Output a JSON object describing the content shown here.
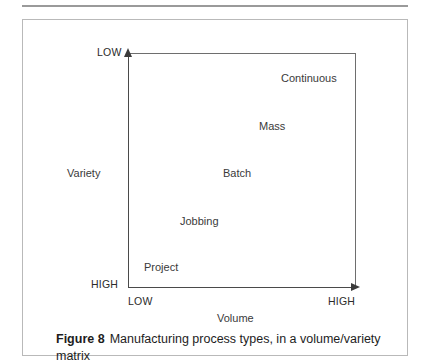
{
  "figure": {
    "caption_prefix": "Figure 8",
    "caption_text": "Manufacturing process types, in a volume/variety matrix"
  },
  "chart_data": {
    "type": "scatter",
    "title": "Manufacturing process types, in a volume/variety matrix",
    "xlabel": "Volume",
    "ylabel": "Variety",
    "grid": false,
    "legend": null,
    "x_axis": {
      "label": "Volume",
      "low_label": "LOW",
      "high_label": "HIGH",
      "direction": "left-to-right increasing"
    },
    "y_axis": {
      "label": "Variety",
      "low_label": "LOW",
      "high_label": "HIGH",
      "direction": "bottom-to-top decreasing"
    },
    "categories": [
      "Project",
      "Jobbing",
      "Batch",
      "Mass",
      "Continuous"
    ],
    "points": [
      {
        "label": "Project",
        "volume": "lowest",
        "variety": "highest"
      },
      {
        "label": "Jobbing",
        "volume": "low",
        "variety": "high"
      },
      {
        "label": "Batch",
        "volume": "medium",
        "variety": "medium"
      },
      {
        "label": "Mass",
        "volume": "high",
        "variety": "low"
      },
      {
        "label": "Continuous",
        "volume": "highest",
        "variety": "lowest"
      }
    ]
  },
  "colors": {
    "axis": "#4a4a4a",
    "frame": "#6e6e6e",
    "border": "#b9b9b9",
    "rule": "#9a9a9a",
    "text": "#2f2f2f"
  }
}
